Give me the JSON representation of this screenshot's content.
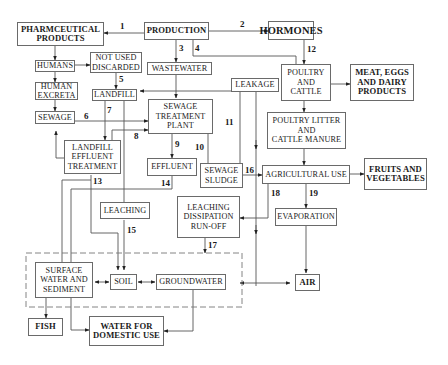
{
  "diagram": {
    "type": "flowchart",
    "nodes": {
      "pharma": "PHARMCEUTICAL\nPRODUCTS",
      "production": "PRODUCTION",
      "hormones": "HORMONES",
      "humans": "HUMANS",
      "not_used": "NOT USED\nDISCARDED",
      "wastewater": "WASTEWATER",
      "leakage": "LEAKAGE",
      "poultry_cattle": "POULTRY\nAND\nCATTLE",
      "meat": "MEAT, EGGS\nAND DAIRY\nPRODUCTS",
      "human_excreta": "HUMAN\nEXCRETA",
      "landfill": "LANDFILL",
      "sewage": "SEWAGE",
      "stp": "SEWAGE\nTREATMENT\nPLANT",
      "litter": "POULTRY LITTER\nAND\nCATTLE MANURE",
      "landfill_eff": "LANDFILL\nEFFLUENT\nTREATMENT",
      "effluent": "EFFLUENT",
      "sludge": "SEWAGE\nSLUDGE",
      "agri": "AGRICULTURAL USE",
      "fruits": "FRUITS AND\nVEGETABLES",
      "leaching": "LEACHING",
      "ldr": "LEACHING\nDISSIPATION\nRUN-OFF",
      "evaporation": "EVAPORATION",
      "surface": "SURFACE\nWATER AND\nSEDIMENT",
      "soil": "SOIL",
      "groundwater": "GROUNDWATER",
      "air": "AIR",
      "fish": "FISH",
      "domestic": "WATER FOR\nDOMESTIC USE"
    },
    "edge_labels": {
      "e1": "1",
      "e2": "2",
      "e3": "3",
      "e4": "4",
      "e5": "5",
      "e6": "6",
      "e7": "7",
      "e8": "8",
      "e9": "9",
      "e10": "10",
      "e11": "11",
      "e12": "12",
      "e13": "13",
      "e14": "14",
      "e15": "15",
      "e16": "16",
      "e17": "17",
      "e18": "18",
      "e19": "19"
    },
    "edges": [
      {
        "label": "1",
        "from": "PRODUCTION",
        "to": "PHARMCEUTICAL PRODUCTS"
      },
      {
        "label": "2",
        "from": "PRODUCTION",
        "to": "HORMONES"
      },
      {
        "label": "3",
        "from": "PRODUCTION",
        "to": "WASTEWATER"
      },
      {
        "label": "4",
        "from": "PRODUCTION",
        "to": "LEAKAGE"
      },
      {
        "label": "5",
        "from": "NOT USED DISCARDED",
        "to": "LANDFILL"
      },
      {
        "label": "6",
        "from": "SEWAGE",
        "to": "SEWAGE TREATMENT PLANT"
      },
      {
        "label": "7",
        "from": "LANDFILL",
        "to": "LANDFILL EFFLUENT TREATMENT"
      },
      {
        "label": "8",
        "from": "LANDFILL EFFLUENT TREATMENT",
        "to": "SEWAGE TREATMENT PLANT"
      },
      {
        "label": "9",
        "from": "SEWAGE TREATMENT PLANT",
        "to": "EFFLUENT"
      },
      {
        "label": "10",
        "from": "SEWAGE TREATMENT PLANT",
        "to": "SEWAGE SLUDGE"
      },
      {
        "label": "11",
        "from": "SEWAGE SLUDGE",
        "to": "LANDFILL"
      },
      {
        "label": "12",
        "from": "HORMONES",
        "to": "POULTRY AND CATTLE"
      },
      {
        "label": "13",
        "from": "LANDFILL EFFLUENT TREATMENT",
        "to": "SOIL"
      },
      {
        "label": "14",
        "from": "EFFLUENT",
        "to": "SURFACE WATER AND SEDIMENT"
      },
      {
        "label": "15",
        "from": "LEACHING",
        "to": "SOIL"
      },
      {
        "label": "16",
        "from": "SEWAGE SLUDGE",
        "to": "AGRICULTURAL USE"
      },
      {
        "label": "17",
        "from": "LEACHING DISSIPATION RUN-OFF",
        "to": "ENVIRONMENT"
      },
      {
        "label": "18",
        "from": "AGRICULTURAL USE",
        "to": "LEACHING DISSIPATION RUN-OFF"
      },
      {
        "label": "19",
        "from": "AGRICULTURAL USE",
        "to": "EVAPORATION"
      }
    ]
  }
}
